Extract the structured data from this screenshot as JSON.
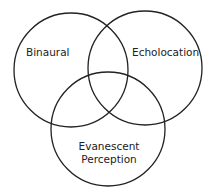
{
  "diagram": {
    "type": "venn",
    "stroke_color": "#222222",
    "sets": [
      {
        "id": "binaural",
        "label": "Binaural",
        "cx": 71,
        "cy": 70,
        "r": 57
      },
      {
        "id": "echolocation",
        "label": "Echolocation",
        "cx": 145,
        "cy": 68,
        "r": 57
      },
      {
        "id": "evanescent",
        "label_line1": "Evanescent",
        "label_line2": "Perception",
        "cx": 108,
        "cy": 129,
        "r": 57
      }
    ]
  }
}
